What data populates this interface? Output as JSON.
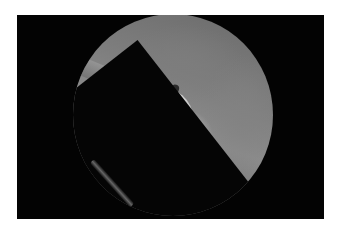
{
  "image": {
    "type": "endoscopic photograph",
    "color_mode": "grayscale",
    "border_color": "#ffffff",
    "frame_color": "#030303",
    "view_shape": "circular"
  }
}
